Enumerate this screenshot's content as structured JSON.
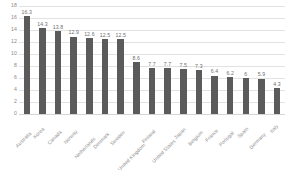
{
  "chart_data": {
    "type": "bar",
    "title": "",
    "subtitle": "",
    "xlabel": "",
    "ylabel": "",
    "ylim": [
      0,
      18
    ],
    "ytick_step": 2,
    "yticks": [
      "0",
      "2",
      "4",
      "6",
      "8",
      "10",
      "12",
      "14",
      "16",
      "18"
    ],
    "grid": true,
    "legend": "none",
    "bar_color": "#5b5b5b",
    "gridline_color": "#e2e2e2",
    "label_color": "#8d8d8d",
    "categories": [
      "Australia",
      "Korea",
      "Canada",
      "Norway",
      "Netherlands",
      "Denmark",
      "Sweden",
      "United Kingdom",
      "Finland",
      "United States",
      "Japan",
      "Belgium",
      "France",
      "Portugal",
      "Spain",
      "Germany",
      "Italy"
    ],
    "values": [
      16.3,
      14.3,
      13.8,
      12.9,
      12.6,
      12.5,
      12.5,
      8.6,
      7.7,
      7.7,
      7.5,
      7.3,
      6.4,
      6.2,
      6,
      5.9,
      4.3
    ],
    "value_labels": [
      "16.3",
      "14.3",
      "13.8",
      "12.9",
      "12.6",
      "12.5",
      "12.5",
      "8.6",
      "7.7",
      "7.7",
      "7.5",
      "7.3",
      "6.4",
      "6.2",
      "6",
      "5.9",
      "4.3"
    ]
  }
}
